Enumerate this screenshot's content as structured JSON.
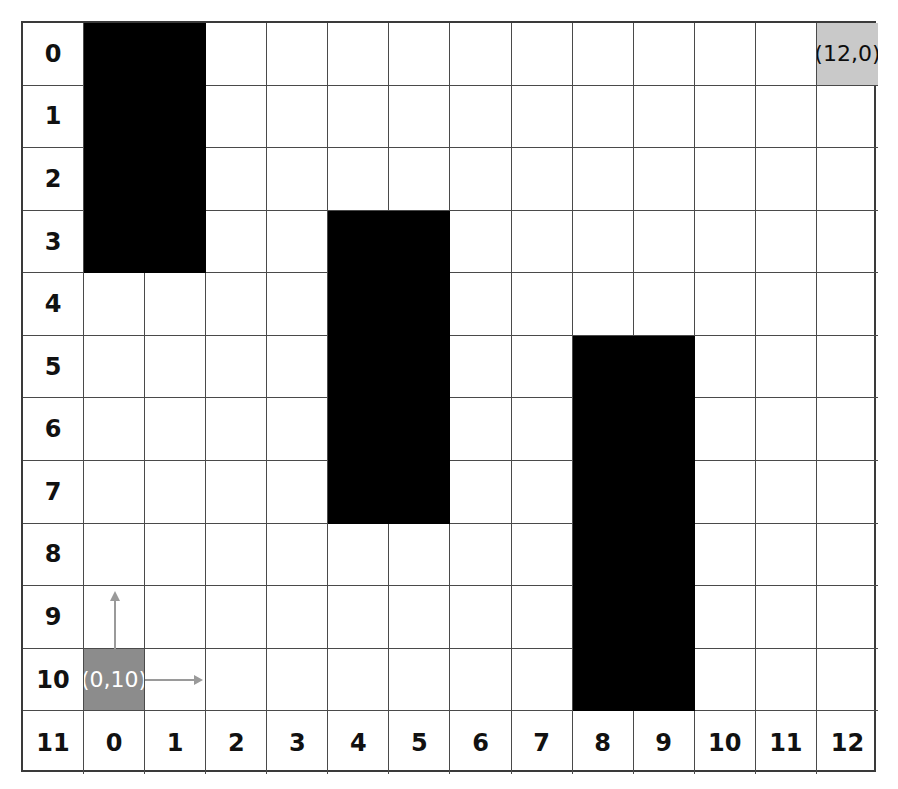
{
  "grid": {
    "columns": 14,
    "rows": 12,
    "origin_x": 21,
    "origin_y": 21,
    "cell_width": 61.07,
    "cell_height": 62.58,
    "border_color": "#3a3a3a",
    "line_color": "#4a4a4a",
    "background": "#ffffff"
  },
  "row_labels": [
    "0",
    "1",
    "2",
    "3",
    "4",
    "5",
    "6",
    "7",
    "8",
    "9",
    "10",
    "11"
  ],
  "column_labels": [
    "0",
    "1",
    "2",
    "3",
    "4",
    "5",
    "6",
    "7",
    "8",
    "9",
    "10",
    "11",
    "12"
  ],
  "markers": [
    {
      "name": "goal-marker",
      "label": "(12,0)",
      "col": 13,
      "row": 0,
      "fill": "#c9c9c9",
      "text_color": "#0d0d0d"
    },
    {
      "name": "origin-marker",
      "label": "(0,10)",
      "col": 1,
      "row": 10,
      "fill": "#8c8c8c",
      "text_color": "#ffffff"
    }
  ],
  "obstacles": [
    {
      "name": "obstacle-left",
      "col_start": 1,
      "col_end": 2,
      "row_start": 0,
      "row_end": 3,
      "fill": "#000000"
    },
    {
      "name": "obstacle-middle",
      "col_start": 5,
      "col_end": 6,
      "row_start": 3,
      "row_end": 7,
      "fill": "#000000"
    },
    {
      "name": "obstacle-right",
      "col_start": 9,
      "col_end": 10,
      "row_start": 5,
      "row_end": 10,
      "fill": "#000000"
    }
  ],
  "axes": {
    "color": "#9a9a9a",
    "x_axis": {
      "name": "x-axis-arrow",
      "direction": "right",
      "length": 58
    },
    "y_axis": {
      "name": "y-axis-arrow",
      "direction": "up",
      "length": 58
    }
  }
}
